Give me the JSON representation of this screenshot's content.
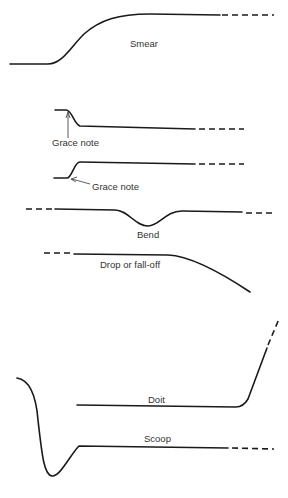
{
  "diagram": {
    "type": "pitch-inflection-curves",
    "ink_color": "#1a1a1a",
    "label_color": "#333333",
    "items": [
      {
        "id": "smear",
        "label": "Smear"
      },
      {
        "id": "grace-note-down",
        "label": "Grace note"
      },
      {
        "id": "grace-note-up",
        "label": "Grace note"
      },
      {
        "id": "bend",
        "label": "Bend"
      },
      {
        "id": "drop",
        "label": "Drop or fall-off"
      },
      {
        "id": "doit",
        "label": "Doit"
      },
      {
        "id": "scoop",
        "label": "Scoop"
      }
    ]
  }
}
